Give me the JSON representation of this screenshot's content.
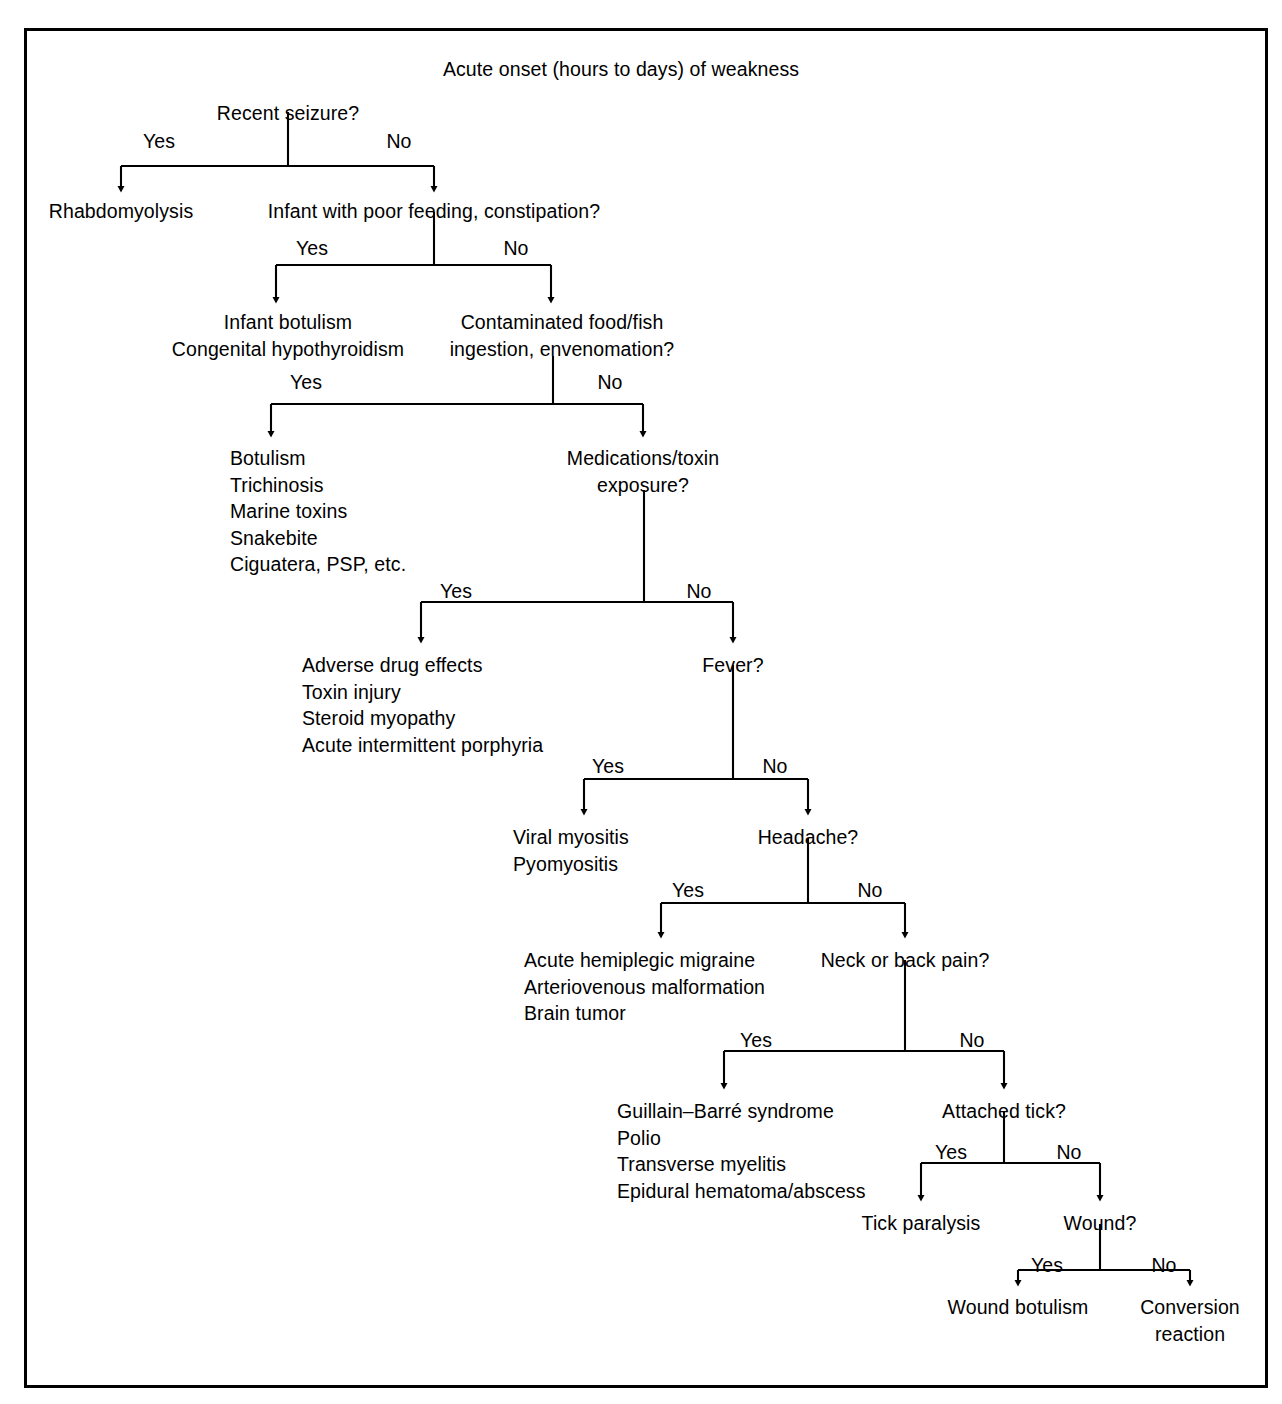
{
  "figure": {
    "title": "Acute onset (hours to days) of weakness",
    "title_x": 621,
    "title_y": 56,
    "branch_yes_label": "Yes",
    "branch_no_label": "No"
  },
  "chart_data": {
    "type": "diagram",
    "subtype": "decision-tree-flowchart",
    "title": "Acute onset (hours to days) of weakness",
    "root": "Acute onset (hours to days) of weakness",
    "decisions": [
      {
        "id": "recent-seizure",
        "question": "Recent seizure?",
        "yes": "rhabdomyolysis",
        "no": "infant-poor-feeding"
      },
      {
        "id": "infant-poor-feeding",
        "question": "Infant with poor feeding, constipation?",
        "yes": "infant-botulism-outcome",
        "no": "contaminated-food"
      },
      {
        "id": "contaminated-food",
        "question": "Contaminated food/fish ingestion, envenomation?",
        "yes": "toxin-outcome",
        "no": "medications-toxin"
      },
      {
        "id": "medications-toxin",
        "question": "Medications/toxin exposure?",
        "yes": "drug-outcome",
        "no": "fever"
      },
      {
        "id": "fever",
        "question": "Fever?",
        "yes": "myositis-outcome",
        "no": "headache"
      },
      {
        "id": "headache",
        "question": "Headache?",
        "yes": "migraine-outcome",
        "no": "neck-back-pain"
      },
      {
        "id": "neck-back-pain",
        "question": "Neck or back pain?",
        "yes": "gbs-outcome",
        "no": "attached-tick"
      },
      {
        "id": "attached-tick",
        "question": "Attached tick?",
        "yes": "tick-paralysis",
        "no": "wound"
      },
      {
        "id": "wound",
        "question": "Wound?",
        "yes": "wound-botulism",
        "no": "conversion-reaction"
      }
    ],
    "outcomes": [
      {
        "id": "rhabdomyolysis",
        "items": [
          "Rhabdomyolysis"
        ]
      },
      {
        "id": "infant-botulism-outcome",
        "items": [
          "Infant botulism",
          "Congenital hypothyroidism"
        ]
      },
      {
        "id": "toxin-outcome",
        "items": [
          "Botulism",
          "Trichinosis",
          "Marine toxins",
          "Snakebite",
          "Ciguatera, PSP, etc."
        ]
      },
      {
        "id": "drug-outcome",
        "items": [
          "Adverse drug effects",
          "Toxin injury",
          "Steroid myopathy",
          "Acute intermittent porphyria"
        ]
      },
      {
        "id": "myositis-outcome",
        "items": [
          "Viral myositis",
          "Pyomyositis"
        ]
      },
      {
        "id": "migraine-outcome",
        "items": [
          "Acute hemiplegic migraine",
          "Arteriovenous malformation",
          "Brain tumor"
        ]
      },
      {
        "id": "gbs-outcome",
        "items": [
          "Guillain–Barré syndrome",
          "Polio",
          "Transverse myelitis",
          "Epidural hematoma/abscess"
        ]
      },
      {
        "id": "tick-paralysis",
        "items": [
          "Tick paralysis"
        ]
      },
      {
        "id": "wound-botulism",
        "items": [
          "Wound botulism"
        ]
      },
      {
        "id": "conversion-reaction",
        "items": [
          "Conversion",
          "reaction"
        ]
      }
    ],
    "edge_labels": [
      "Yes",
      "No"
    ],
    "colors": {
      "line": "#000000",
      "text": "#000000",
      "background": "#ffffff",
      "border": "#000000"
    }
  },
  "nodes": [
    {
      "name": "node-recent-seizure",
      "text": "Recent seizure?",
      "x": 288,
      "y": 100,
      "align": "ctr"
    },
    {
      "name": "node-rhabdomyolysis",
      "text": "Rhabdomyolysis",
      "x": 121,
      "y": 198,
      "align": "ctr"
    },
    {
      "name": "node-infant-poor-feeding",
      "text": "Infant with poor feeding, constipation?",
      "x": 434,
      "y": 198,
      "align": "ctr"
    },
    {
      "name": "node-infant-botulism",
      "text": "Infant botulism\nCongenital hypothyroidism",
      "x": 288,
      "y": 309,
      "align": "ctr"
    },
    {
      "name": "node-contaminated-food",
      "text": "Contaminated food/fish\ningestion, envenomation?",
      "x": 562,
      "y": 309,
      "align": "ctr"
    },
    {
      "name": "node-toxin-outcome",
      "text": "Botulism\nTrichinosis\nMarine toxins\nSnakebite\nCiguatera, PSP, etc.",
      "x": 230,
      "y": 445,
      "align": "lft"
    },
    {
      "name": "node-medications-toxin",
      "text": "Medications/toxin\nexposure?",
      "x": 643,
      "y": 445,
      "align": "ctr"
    },
    {
      "name": "node-drug-outcome",
      "text": "Adverse drug effects\nToxin injury\nSteroid myopathy\nAcute intermittent porphyria",
      "x": 302,
      "y": 652,
      "align": "lft"
    },
    {
      "name": "node-fever",
      "text": "Fever?",
      "x": 733,
      "y": 652,
      "align": "ctr"
    },
    {
      "name": "node-myositis-outcome",
      "text": "Viral myositis\nPyomyositis",
      "x": 513,
      "y": 824,
      "align": "lft"
    },
    {
      "name": "node-headache",
      "text": "Headache?",
      "x": 808,
      "y": 824,
      "align": "ctr"
    },
    {
      "name": "node-migraine-outcome",
      "text": "Acute hemiplegic migraine\nArteriovenous malformation\nBrain tumor",
      "x": 524,
      "y": 947,
      "align": "lft"
    },
    {
      "name": "node-neck-back-pain",
      "text": "Neck or back pain?",
      "x": 905,
      "y": 947,
      "align": "ctr"
    },
    {
      "name": "node-gbs-outcome",
      "text": "Guillain–Barré syndrome\nPolio\nTransverse myelitis\nEpidural hematoma/abscess",
      "x": 617,
      "y": 1098,
      "align": "lft"
    },
    {
      "name": "node-attached-tick",
      "text": "Attached tick?",
      "x": 1004,
      "y": 1098,
      "align": "ctr"
    },
    {
      "name": "node-tick-paralysis",
      "text": "Tick paralysis",
      "x": 921,
      "y": 1210,
      "align": "ctr"
    },
    {
      "name": "node-wound",
      "text": "Wound?",
      "x": 1100,
      "y": 1210,
      "align": "ctr"
    },
    {
      "name": "node-wound-botulism",
      "text": "Wound botulism",
      "x": 1018,
      "y": 1294,
      "align": "ctr"
    },
    {
      "name": "node-conversion-reaction",
      "text": "Conversion\nreaction",
      "x": 1190,
      "y": 1294,
      "align": "ctr"
    }
  ],
  "branches": [
    {
      "name": "branch-recent-seizure",
      "stem_x": 288,
      "stem_y0": 112,
      "bar_y": 166,
      "left_x": 121,
      "right_x": 434,
      "arrow_y": 189,
      "yes_x": 159,
      "no_x": 399,
      "label_y": 130
    },
    {
      "name": "branch-infant-poor-feeding",
      "stem_x": 434,
      "stem_y0": 212,
      "bar_y": 265,
      "left_x": 276,
      "right_x": 551,
      "arrow_y": 300,
      "yes_x": 312,
      "no_x": 516,
      "label_y": 237
    },
    {
      "name": "branch-contaminated-food",
      "stem_x": 553,
      "stem_y0": 356,
      "bar_y": 404,
      "left_x": 271,
      "right_x": 643,
      "arrow_y": 434,
      "yes_x": 306,
      "no_x": 610,
      "label_y": 371
    },
    {
      "name": "branch-medications-toxin",
      "stem_x": 644,
      "stem_y0": 490,
      "bar_y": 602,
      "left_x": 421,
      "right_x": 733,
      "arrow_y": 640,
      "yes_x": 456,
      "no_x": 699,
      "label_y": 580
    },
    {
      "name": "branch-fever",
      "stem_x": 733,
      "stem_y0": 665,
      "bar_y": 779,
      "left_x": 584,
      "right_x": 808,
      "arrow_y": 812,
      "yes_x": 608,
      "no_x": 775,
      "label_y": 755
    },
    {
      "name": "branch-headache",
      "stem_x": 808,
      "stem_y0": 838,
      "bar_y": 903,
      "left_x": 661,
      "right_x": 905,
      "arrow_y": 935,
      "yes_x": 688,
      "no_x": 870,
      "label_y": 879
    },
    {
      "name": "branch-neck-back-pain",
      "stem_x": 905,
      "stem_y0": 960,
      "bar_y": 1051,
      "left_x": 724,
      "right_x": 1004,
      "arrow_y": 1086,
      "yes_x": 756,
      "no_x": 972,
      "label_y": 1029
    },
    {
      "name": "branch-attached-tick",
      "stem_x": 1004,
      "stem_y0": 1112,
      "bar_y": 1163,
      "left_x": 921,
      "right_x": 1100,
      "arrow_y": 1198,
      "yes_x": 951,
      "no_x": 1069,
      "label_y": 1141
    },
    {
      "name": "branch-wound",
      "stem_x": 1100,
      "stem_y0": 1224,
      "bar_y": 1270,
      "left_x": 1018,
      "right_x": 1190,
      "arrow_y": 1283,
      "yes_x": 1047,
      "no_x": 1164,
      "label_y": 1254
    }
  ]
}
